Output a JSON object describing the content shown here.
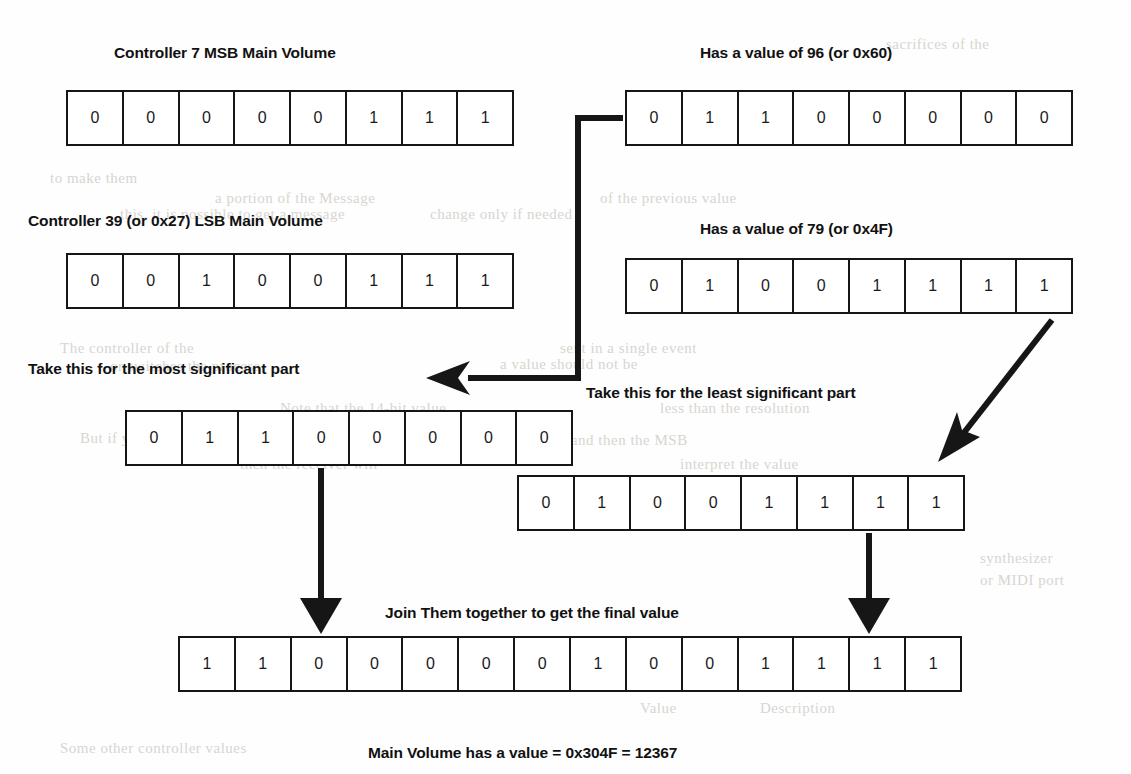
{
  "diagram": {
    "title_caption": "Main Volume has a value = 0x304F = 12367",
    "rows": [
      {
        "id": "controller7-msb",
        "label": "Controller 7 MSB Main Volume",
        "bits": [
          "0",
          "0",
          "0",
          "0",
          "0",
          "1",
          "1",
          "1"
        ]
      },
      {
        "id": "value-96",
        "label": "Has a value of 96 (or 0x60)",
        "bits": [
          "0",
          "1",
          "1",
          "0",
          "0",
          "0",
          "0",
          "0"
        ]
      },
      {
        "id": "controller39-lsb",
        "label": "Controller 39 (or 0x27) LSB Main Volume",
        "bits": [
          "0",
          "0",
          "1",
          "0",
          "0",
          "1",
          "1",
          "1"
        ]
      },
      {
        "id": "value-79",
        "label": "Has a value of 79 (or 0x4F)",
        "bits": [
          "0",
          "1",
          "0",
          "0",
          "1",
          "1",
          "1",
          "1"
        ]
      },
      {
        "id": "most-significant-part",
        "label": "Take this for the most significant part",
        "bits": [
          "0",
          "1",
          "1",
          "0",
          "0",
          "0",
          "0",
          "0"
        ]
      },
      {
        "id": "least-significant-part",
        "label": "Take this for the least significant part",
        "bits": [
          "0",
          "1",
          "0",
          "0",
          "1",
          "1",
          "1",
          "1"
        ]
      },
      {
        "id": "joined-final-value",
        "label": "Join Them together to get the final value",
        "bits": [
          "1",
          "1",
          "0",
          "0",
          "0",
          "0",
          "0",
          "1",
          "0",
          "0",
          "1",
          "1",
          "1",
          "1"
        ]
      }
    ],
    "arrows": [
      {
        "name": "elbow-to-most-significant",
        "type": "elbow"
      },
      {
        "name": "diagonal-to-least-significant",
        "type": "diagonal"
      },
      {
        "name": "down-arrow-left",
        "type": "vertical"
      },
      {
        "name": "down-arrow-right",
        "type": "vertical"
      }
    ],
    "colors": {
      "ink": "#161616",
      "text": "#111111",
      "background": "#fefefe",
      "ghost": "#d8d5d0"
    }
  },
  "ghost_text": [
    {
      "t": "sacrifices of the",
      "x": 886,
      "y": 36
    },
    {
      "t": "to make them",
      "x": 50,
      "y": 170
    },
    {
      "t": "a portion of the Message",
      "x": 215,
      "y": 190
    },
    {
      "t": "this, it is possible to get a message",
      "x": 120,
      "y": 206
    },
    {
      "t": "of the previous value",
      "x": 600,
      "y": 190
    },
    {
      "t": "change only if needed",
      "x": 430,
      "y": 206
    },
    {
      "t": "The controller of the",
      "x": 60,
      "y": 340
    },
    {
      "t": "or switches the process",
      "x": 110,
      "y": 358
    },
    {
      "t": "sent in a single event",
      "x": 560,
      "y": 340
    },
    {
      "t": "a value should not be",
      "x": 500,
      "y": 356
    },
    {
      "t": "Note that the 14-bit value",
      "x": 280,
      "y": 400
    },
    {
      "t": "less than the resolution",
      "x": 660,
      "y": 400
    },
    {
      "t": "But if you send the LSB",
      "x": 80,
      "y": 430
    },
    {
      "t": "first and then the MSB",
      "x": 540,
      "y": 432
    },
    {
      "t": "then the receiver will",
      "x": 240,
      "y": 456
    },
    {
      "t": "interpret the value",
      "x": 680,
      "y": 456
    },
    {
      "t": "synthesizer",
      "x": 980,
      "y": 550
    },
    {
      "t": "or MIDI port",
      "x": 980,
      "y": 572
    },
    {
      "t": "Table",
      "x": 400,
      "y": 640
    },
    {
      "t": "Value",
      "x": 640,
      "y": 700
    },
    {
      "t": "Description",
      "x": 760,
      "y": 700
    },
    {
      "t": "Some other controller values",
      "x": 60,
      "y": 740
    }
  ]
}
